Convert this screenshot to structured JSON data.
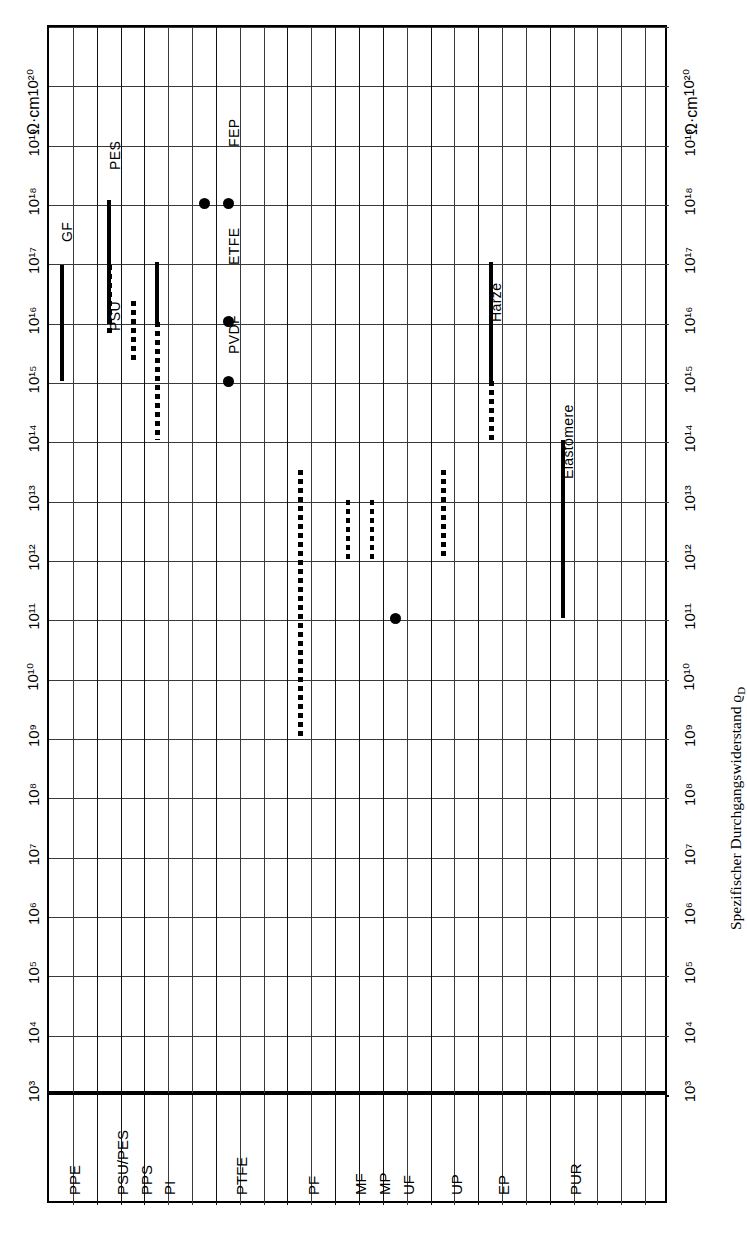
{
  "caption": "Spezifischer Durchgangswiderstand ϱD",
  "caption_main": "Spezifischer Durchgangswiderstand ϱ",
  "caption_sub": "D",
  "unit": "Ω·cm",
  "axis": {
    "type": "log10",
    "min_exponent": 3,
    "max_exponent": 21,
    "tick_labels": [
      "10³",
      "10⁴",
      "10⁵",
      "10⁶",
      "10⁷",
      "10⁸",
      "10⁹",
      "10¹⁰",
      "10¹¹",
      "10¹²",
      "10¹³",
      "10¹⁴",
      "10¹⁵",
      "10¹⁶",
      "10¹⁷",
      "10¹⁸",
      "10¹⁹",
      "10²⁰"
    ],
    "tick_exponents": [
      3,
      4,
      5,
      6,
      7,
      8,
      9,
      10,
      11,
      12,
      13,
      14,
      15,
      16,
      17,
      18,
      19,
      20
    ]
  },
  "row_labels": [
    {
      "label": "PPE",
      "col": 0
    },
    {
      "label": "PSU/PES",
      "col": 2
    },
    {
      "label": "PPS",
      "col": 3
    },
    {
      "label": "PI",
      "col": 4
    },
    {
      "label": "PTFE",
      "col": 7
    },
    {
      "label": "PF",
      "col": 10
    },
    {
      "label": "MF",
      "col": 12
    },
    {
      "label": "MP",
      "col": 13
    },
    {
      "label": "UF",
      "col": 14
    },
    {
      "label": "UP",
      "col": 16
    },
    {
      "label": "EP",
      "col": 18
    },
    {
      "label": "PUR",
      "col": 21
    }
  ],
  "annotations": [
    {
      "label": "GF",
      "col": 0
    },
    {
      "label": "PES",
      "col": 2
    },
    {
      "label": "PSU",
      "col": 2
    },
    {
      "label": "FEP",
      "col": 7
    },
    {
      "label": "ETFE",
      "col": 7
    },
    {
      "label": "PVDF",
      "col": 7
    },
    {
      "label": "Harze",
      "col": 18
    },
    {
      "label": "Elastomere",
      "col": 21
    }
  ],
  "chart_data": {
    "type": "bar",
    "title": "Spezifischer Durchgangswiderstand ϱD",
    "xlabel": "",
    "ylabel": "Ω·cm",
    "scale": "log10",
    "ylim": [
      1000,
      1e+21
    ],
    "grid": true,
    "orientation": "horizontal-bars-rotated",
    "note": "Ranges of specific volume resistivity for plastics. Solid bars = solid line in figure, dashed bars = dotted line, dot = single value.",
    "categories": [
      "PPE",
      "PSU/PES",
      "PPS",
      "PI",
      "PTFE",
      "PF",
      "MF",
      "MP",
      "UF",
      "UP",
      "EP",
      "PUR"
    ],
    "series": [
      {
        "name": "GF",
        "category": "PPE",
        "style": "solid",
        "low_exp": 15.0,
        "high_exp": 16.95,
        "col": 0
      },
      {
        "name": "PES",
        "category": "PSU/PES",
        "style": "solid",
        "low_exp": 16.95,
        "high_exp": 18.05,
        "col": 2
      },
      {
        "name": "PSU",
        "category": "PSU/PES",
        "style": "solid",
        "low_exp": 16.0,
        "high_exp": 16.95,
        "col": 2
      },
      {
        "name": "PSU-dash",
        "category": "PSU/PES",
        "style": "dashed",
        "low_exp": 15.75,
        "high_exp": 16.95,
        "col": 2
      },
      {
        "name": "PPS",
        "category": "PPS",
        "style": "dashed",
        "low_exp": 15.35,
        "high_exp": 16.35,
        "col": 3
      },
      {
        "name": "PI-solid",
        "category": "PI",
        "style": "solid",
        "low_exp": 16.0,
        "high_exp": 17.0,
        "col": 4
      },
      {
        "name": "PI-dash",
        "category": "PI",
        "style": "dashed",
        "low_exp": 14.0,
        "high_exp": 16.0,
        "col": 4
      },
      {
        "name": "FEP",
        "category": "PTFE",
        "style": "dot",
        "value_exp": 18.0,
        "col": 7
      },
      {
        "name": "PTFE",
        "category": "PTFE",
        "style": "dot",
        "value_exp": 18.0,
        "col": 6
      },
      {
        "name": "ETFE",
        "category": "PTFE",
        "style": "dot",
        "value_exp": 16.0,
        "col": 7
      },
      {
        "name": "PVDF",
        "category": "PTFE",
        "style": "dot",
        "value_exp": 15.0,
        "col": 7
      },
      {
        "name": "PF",
        "category": "PF",
        "style": "dashed",
        "low_exp": 9.0,
        "high_exp": 13.5,
        "col": 10
      },
      {
        "name": "MF",
        "category": "MF",
        "style": "dashed",
        "low_exp": 12.0,
        "high_exp": 13.0,
        "col": 12
      },
      {
        "name": "MP",
        "category": "MP",
        "style": "dashed",
        "low_exp": 12.0,
        "high_exp": 13.0,
        "col": 13
      },
      {
        "name": "UF",
        "category": "UF",
        "style": "dot",
        "value_exp": 11.0,
        "col": 14
      },
      {
        "name": "UP",
        "category": "UP",
        "style": "dashed",
        "low_exp": 12.0,
        "high_exp": 13.5,
        "col": 16
      },
      {
        "name": "Harze",
        "category": "EP",
        "style": "solid",
        "low_exp": 15.0,
        "high_exp": 17.0,
        "col": 18
      },
      {
        "name": "Harze-dash",
        "category": "EP",
        "style": "dashed",
        "low_exp": 14.0,
        "high_exp": 15.0,
        "col": 18
      },
      {
        "name": "Elastomere",
        "category": "PUR",
        "style": "solid",
        "low_exp": 11.0,
        "high_exp": 14.0,
        "col": 21
      }
    ]
  }
}
